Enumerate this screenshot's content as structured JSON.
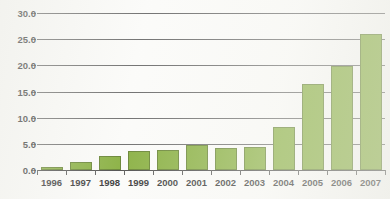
{
  "chart_data": {
    "type": "bar",
    "title": "",
    "title_note": "title cropped off top edge of image",
    "xlabel": "",
    "ylabel": "",
    "categories": [
      "1996",
      "1997",
      "1998",
      "1999",
      "2000",
      "2001",
      "2002",
      "2003",
      "2004",
      "2005",
      "2006",
      "2007"
    ],
    "values": [
      0.6,
      1.5,
      2.7,
      3.7,
      3.9,
      4.8,
      4.3,
      4.4,
      8.3,
      16.4,
      19.8,
      26.0
    ],
    "ylim": [
      0.0,
      30.0
    ],
    "ytick_labels": [
      "0.0",
      "5.0",
      "10.0",
      "15.0",
      "20.0",
      "25.0",
      "30.0"
    ],
    "ytick_values": [
      0.0,
      5.0,
      10.0,
      15.0,
      20.0,
      25.0,
      30.0
    ],
    "grid": true,
    "grid_axis": "y",
    "legend": false,
    "legend_position": "none",
    "series": [
      {
        "name": "",
        "values": [
          0.6,
          1.5,
          2.7,
          3.7,
          3.9,
          4.8,
          4.3,
          4.4,
          8.3,
          16.4,
          19.8,
          26.0
        ]
      }
    ],
    "colors": {
      "bar_fill": "#7ca72c",
      "bar_border": "#56761c",
      "gridline": "#5d5d5d",
      "axis": "#3a3a3a",
      "text": "#1f1f1f",
      "background": "#fbfbf9"
    }
  }
}
